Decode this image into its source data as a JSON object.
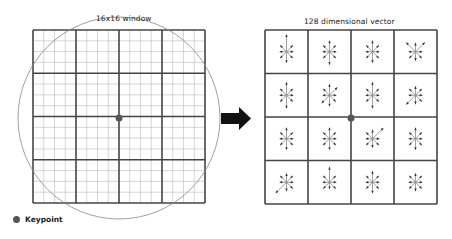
{
  "left_panel": {
    "title": "16x16 window",
    "grid_size": 16,
    "block_size": 4,
    "grid": {
      "x": 33,
      "y": 30,
      "w": 172,
      "h": 173
    },
    "circle": {
      "cx": 119,
      "cy": 118,
      "r": 101
    },
    "keypoint": {
      "cx": 119,
      "cy": 118
    }
  },
  "arrow": {
    "icon": "right-arrow-icon",
    "color": "#111111"
  },
  "right_panel": {
    "title": "128 dimensional vector",
    "grid": {
      "x": 265,
      "y": 30,
      "w": 172,
      "h": 174
    },
    "rows": 4,
    "cols": 4,
    "bins_per_cell": 8,
    "keypoint": {
      "cx": 351,
      "cy": 118
    },
    "histograms": [
      [
        [
          8,
          4,
          3,
          4,
          5,
          4,
          3,
          4
        ],
        [
          5,
          4,
          3,
          4,
          6,
          4,
          3,
          4
        ],
        [
          5,
          4,
          3,
          4,
          5,
          4,
          3,
          4
        ],
        [
          4,
          6,
          3,
          4,
          4,
          4,
          3,
          6
        ]
      ],
      [
        [
          6,
          4,
          3,
          4,
          6,
          4,
          3,
          4
        ],
        [
          5,
          5,
          3,
          4,
          5,
          5,
          3,
          4
        ],
        [
          6,
          4,
          3,
          4,
          6,
          4,
          3,
          4
        ],
        [
          4,
          4,
          3,
          4,
          4,
          6,
          3,
          4
        ]
      ],
      [
        [
          5,
          4,
          3,
          4,
          5,
          4,
          3,
          4
        ],
        [
          5,
          4,
          3,
          4,
          5,
          4,
          3,
          4
        ],
        [
          4,
          7,
          3,
          4,
          4,
          4,
          3,
          4
        ],
        [
          5,
          4,
          3,
          4,
          5,
          4,
          3,
          4
        ]
      ],
      [
        [
          4,
          4,
          3,
          4,
          4,
          7,
          3,
          4
        ],
        [
          7,
          4,
          3,
          4,
          3,
          4,
          3,
          4
        ],
        [
          5,
          4,
          3,
          4,
          5,
          4,
          3,
          4
        ],
        [
          4,
          4,
          3,
          4,
          4,
          4,
          3,
          4
        ]
      ]
    ]
  },
  "legend": {
    "label": "Keypoint",
    "color": "#555555"
  },
  "colors": {
    "grid_major": "#444444",
    "grid_minor": "#bbbbbb",
    "circle": "#888888",
    "arrows": "#333333"
  }
}
